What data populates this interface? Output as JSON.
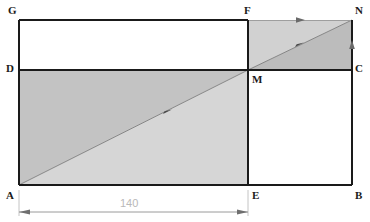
{
  "figure": {
    "colors": {
      "stroke": "#1a1a1a",
      "background": "#ffffff",
      "shade_dark": "#c3c3c3",
      "shade_light": "#d6d6d6",
      "dimension_line": "#9a9a9a",
      "dimension_text": "#b9b9b9",
      "diagonal_line": "#7a7a7a"
    },
    "vertices": [
      {
        "id": "G",
        "label": "G",
        "x": 19,
        "y": 20,
        "label_x": 8,
        "label_y": 5
      },
      {
        "id": "F",
        "label": "F",
        "x": 248,
        "y": 20,
        "label_x": 244,
        "label_y": 5
      },
      {
        "id": "N",
        "label": "N",
        "x": 352,
        "y": 20,
        "label_x": 355,
        "label_y": 5
      },
      {
        "id": "D",
        "label": "D",
        "x": 19,
        "y": 70,
        "label_x": 6,
        "label_y": 63
      },
      {
        "id": "M",
        "label": "M",
        "x": 248,
        "y": 70,
        "label_x": 252,
        "label_y": 74
      },
      {
        "id": "C",
        "label": "C",
        "x": 352,
        "y": 70,
        "label_x": 355,
        "label_y": 63
      },
      {
        "id": "A",
        "label": "A",
        "x": 19,
        "y": 185,
        "label_x": 6,
        "label_y": 190
      },
      {
        "id": "E",
        "label": "E",
        "x": 248,
        "y": 185,
        "label_x": 252,
        "label_y": 190
      },
      {
        "id": "B",
        "label": "B",
        "x": 352,
        "y": 185,
        "label_x": 355,
        "label_y": 190
      }
    ],
    "edges": [
      {
        "name": "edge-G-F",
        "from": "G",
        "to": "F"
      },
      {
        "name": "edge-G-D",
        "from": "G",
        "to": "D"
      },
      {
        "name": "edge-D-C",
        "from": "D",
        "to": "C"
      },
      {
        "name": "edge-A-B",
        "from": "A",
        "to": "B"
      },
      {
        "name": "edge-A-D",
        "from": "A",
        "to": "D"
      },
      {
        "name": "edge-F-E",
        "from": "F",
        "to": "E"
      },
      {
        "name": "edge-N-B",
        "from": "N",
        "to": "B"
      },
      {
        "name": "edge-F-N",
        "from": "F",
        "to": "N"
      }
    ],
    "diagonals": [
      {
        "name": "diagonal-A-M",
        "from": "A",
        "to": "M",
        "arrow_at": {
          "x": 168,
          "y": 112
        }
      },
      {
        "name": "diagonal-M-N",
        "from": "M",
        "to": "N",
        "arrow_at": {
          "x": 300,
          "y": 45
        }
      }
    ],
    "shaded_regions": [
      {
        "name": "shade-triangle-A-D-M",
        "points": "19,185 19,70 248,70",
        "fill": "#c3c3c3"
      },
      {
        "name": "shade-triangle-A-M-E",
        "points": "19,185 248,70 248,185",
        "fill": "#d6d6d6"
      },
      {
        "name": "shade-triangle-F-M-N",
        "points": "248,20 248,70 352,20",
        "fill": "#d0d0d0"
      },
      {
        "name": "shade-triangle-M-C-N",
        "points": "248,70 352,70 352,20",
        "fill": "#bdbdbd"
      }
    ],
    "direction_markers": [
      {
        "name": "arrow-top-edge-FN",
        "x": 300,
        "y": 20,
        "angle": 0
      },
      {
        "name": "arrow-right-edge-NC",
        "x": 352,
        "y": 45,
        "angle": -90
      }
    ]
  },
  "dimension": {
    "name": "dimension-A-E",
    "value": "140",
    "text_x": 120,
    "text_y": 200,
    "line_y": 212,
    "start_x": 19,
    "end_x": 248,
    "extension_top_y": 190
  }
}
